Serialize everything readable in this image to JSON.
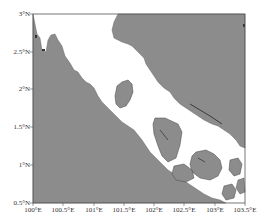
{
  "map": {
    "type": "coastline map",
    "region": "Strait of Malacca",
    "extent": {
      "lon": [
        100.0,
        103.5
      ],
      "lat": [
        0.5,
        3.0
      ]
    },
    "colors": {
      "land": "#8c8c8c",
      "sea": "#ffffff",
      "frame": "#555555",
      "coast_detail": "#3a3a3a"
    },
    "y_ticks": [
      {
        "value": 3.0,
        "label": "3°N"
      },
      {
        "value": 2.5,
        "label": "2.5°N"
      },
      {
        "value": 2.0,
        "label": "2°N"
      },
      {
        "value": 1.5,
        "label": "1.5°N"
      },
      {
        "value": 1.0,
        "label": "1°N"
      },
      {
        "value": 0.5,
        "label": "0.5°N"
      }
    ],
    "x_ticks": [
      {
        "value": 100.0,
        "label": "100°E"
      },
      {
        "value": 100.5,
        "label": "100.5°E"
      },
      {
        "value": 101.0,
        "label": "101°E"
      },
      {
        "value": 101.5,
        "label": "101.5°E"
      },
      {
        "value": 102.0,
        "label": "102°E"
      },
      {
        "value": 102.5,
        "label": "102.5°E"
      },
      {
        "value": 103.0,
        "label": "103°E"
      },
      {
        "value": 103.5,
        "label": "103.5°E"
      }
    ]
  }
}
